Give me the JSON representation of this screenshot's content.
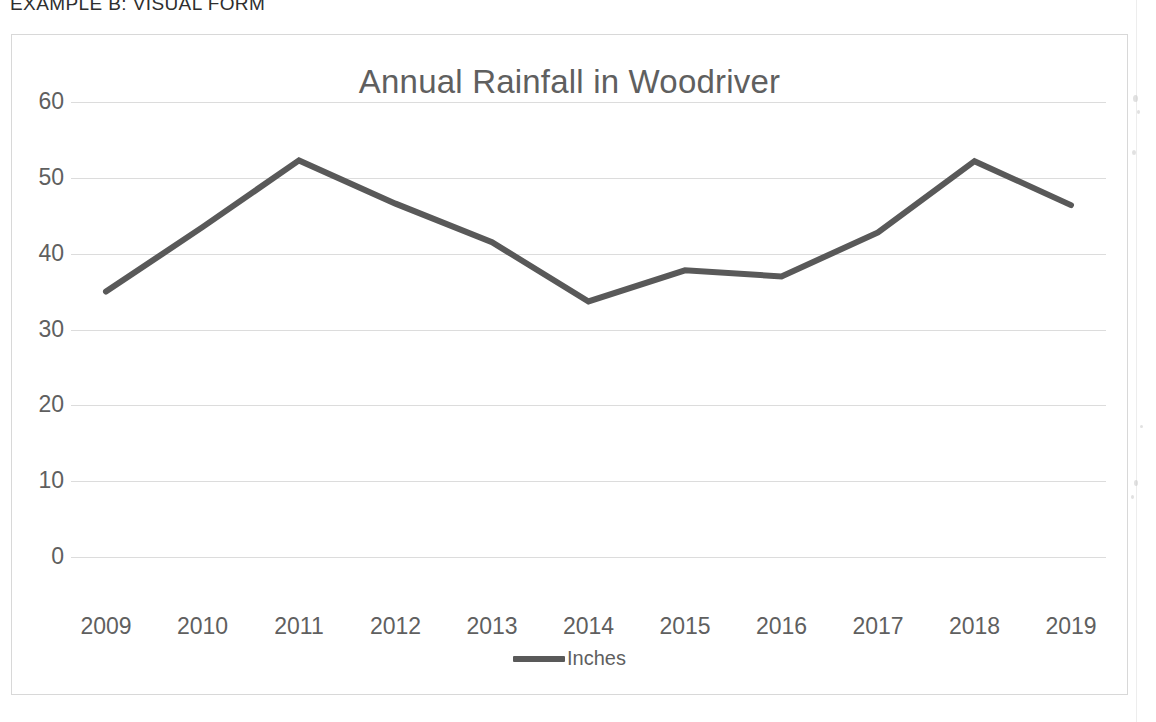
{
  "document": {
    "header": "EXAMPLE B: VISUAL FORM"
  },
  "chart": {
    "title": "Annual Rainfall in Woodriver",
    "legend_label": "Inches"
  },
  "chart_data": {
    "type": "line",
    "title": "Annual Rainfall in Woodriver",
    "xlabel": "",
    "ylabel": "",
    "categories": [
      "2009",
      "2010",
      "2011",
      "2012",
      "2013",
      "2014",
      "2015",
      "2016",
      "2017",
      "2018",
      "2019"
    ],
    "series": [
      {
        "name": "Inches",
        "values": [
          35.0,
          43.5,
          52.3,
          46.6,
          41.5,
          33.7,
          37.8,
          37.0,
          42.8,
          52.2,
          46.4
        ],
        "color": "#595959"
      }
    ],
    "ylim": [
      0,
      60
    ],
    "yticks": [
      0,
      10,
      20,
      30,
      40,
      50,
      60
    ],
    "ytick_labels": [
      "0",
      "10",
      "20",
      "30",
      "40",
      "50",
      "60"
    ],
    "grid": true,
    "grid_color": "#dcdcdc",
    "legend_position": "bottom"
  }
}
